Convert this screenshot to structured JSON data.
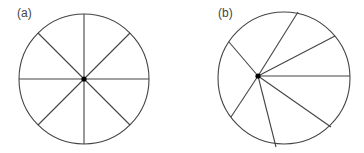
{
  "panels": [
    {
      "label": "(a)",
      "center": [
        84,
        79
      ],
      "radius": 65,
      "hub": [
        84,
        79
      ],
      "spokes": [
        [
          84,
          14
        ],
        [
          130,
          33
        ],
        [
          149,
          79
        ],
        [
          130,
          125
        ],
        [
          84,
          144
        ],
        [
          38,
          125
        ],
        [
          19,
          79
        ],
        [
          38,
          33
        ]
      ]
    },
    {
      "label": "(b)",
      "center": [
        284,
        78
      ],
      "radius": 66,
      "hub": [
        258,
        76
      ],
      "spokes": [
        [
          298,
          12
        ],
        [
          335,
          36
        ],
        [
          350,
          76
        ],
        [
          331,
          127
        ],
        [
          276,
          147
        ],
        [
          231,
          117
        ],
        [
          229,
          42
        ]
      ]
    }
  ],
  "colors": {
    "stroke": "#444444",
    "hub": "#000000"
  }
}
